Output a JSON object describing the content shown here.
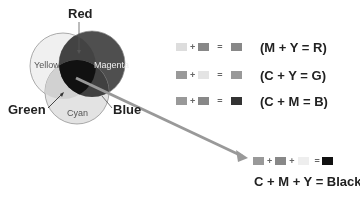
{
  "labels": {
    "red": "Red",
    "green": "Green",
    "blue": "Blue"
  },
  "circles": {
    "yellow": "Yellow",
    "magenta": "Magenta",
    "cyan": "Cyan"
  },
  "colors": {
    "yellow": "#f7f3c0",
    "magenta": "#8c3a6e",
    "cyan": "#d8e8f0",
    "red": "#7a3340",
    "green": "#c8d8a8",
    "blue": "#4a3a60",
    "black": "#111111",
    "arrow": "#999999"
  },
  "equations": [
    {
      "op1": "+",
      "op2": "=",
      "formula": "(M + Y = R)"
    },
    {
      "op1": "+",
      "op2": "=",
      "formula": "(C + Y = G)"
    },
    {
      "op1": "+",
      "op2": "=",
      "formula": "(C + M = B)"
    }
  ],
  "black_eq": {
    "op1": "+",
    "op2": "+",
    "op3": "=",
    "formula": "C + M + Y = Black"
  }
}
